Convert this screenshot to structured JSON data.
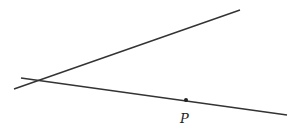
{
  "diagram": {
    "lines": [
      {
        "name": "line-1",
        "x1": 14,
        "y1": 89,
        "x2": 240,
        "y2": 10
      },
      {
        "name": "line-2",
        "x1": 21,
        "y1": 78,
        "x2": 287,
        "y2": 115
      }
    ],
    "point": {
      "label": "P",
      "x": 186,
      "y": 100
    },
    "stroke_color": "#333333"
  }
}
